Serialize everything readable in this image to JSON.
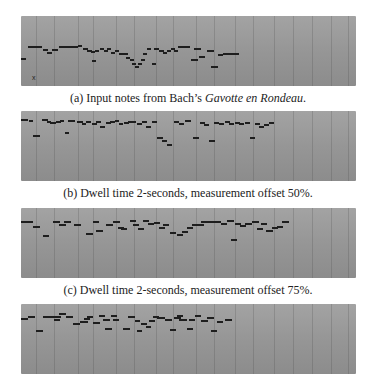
{
  "figure": {
    "panels": [
      {
        "id": "a",
        "top": 16,
        "caption_prefix": "(a) Input notes from Bach’s ",
        "caption_italic": "Gavotte en Rondeau",
        "caption_suffix": ".",
        "caption_top": 91,
        "marker": "x",
        "notes": [
          [
            0,
            42,
            5
          ],
          [
            7,
            30,
            14
          ],
          [
            22,
            33,
            5
          ],
          [
            26,
            36,
            5
          ],
          [
            31,
            33,
            6
          ],
          [
            38,
            30,
            19
          ],
          [
            57,
            29,
            4
          ],
          [
            62,
            32,
            5
          ],
          [
            66,
            34,
            5
          ],
          [
            70,
            35,
            4
          ],
          [
            71,
            44,
            4
          ],
          [
            74,
            34,
            4
          ],
          [
            79,
            32,
            4
          ],
          [
            83,
            34,
            4
          ],
          [
            86,
            32,
            4
          ],
          [
            90,
            36,
            4
          ],
          [
            94,
            34,
            4
          ],
          [
            98,
            37,
            4
          ],
          [
            102,
            37,
            5
          ],
          [
            105,
            41,
            4
          ],
          [
            109,
            43,
            4
          ],
          [
            111,
            47,
            4
          ],
          [
            114,
            50,
            4
          ],
          [
            117,
            47,
            4
          ],
          [
            120,
            43,
            4
          ],
          [
            122,
            37,
            4
          ],
          [
            126,
            32,
            4
          ],
          [
            131,
            47,
            4
          ],
          [
            133,
            32,
            5
          ],
          [
            138,
            34,
            5
          ],
          [
            142,
            36,
            4
          ],
          [
            146,
            34,
            4
          ],
          [
            150,
            32,
            4
          ],
          [
            153,
            34,
            4
          ],
          [
            157,
            30,
            12
          ],
          [
            170,
            43,
            7
          ],
          [
            173,
            32,
            7
          ],
          [
            178,
            40,
            6
          ],
          [
            186,
            34,
            7
          ],
          [
            190,
            50,
            7
          ],
          [
            197,
            38,
            5
          ],
          [
            202,
            37,
            5
          ],
          [
            206,
            37,
            12
          ]
        ]
      },
      {
        "id": "b",
        "top": 111,
        "caption_text": "(b) Dwell time 2-seconds, measurement offset 50%.",
        "caption_top": 186,
        "notes": [
          [
            0,
            8,
            7
          ],
          [
            8,
            9,
            4
          ],
          [
            12,
            24,
            7
          ],
          [
            21,
            8,
            6
          ],
          [
            26,
            10,
            4
          ],
          [
            29,
            11,
            6
          ],
          [
            35,
            10,
            5
          ],
          [
            39,
            9,
            4
          ],
          [
            44,
            21,
            4
          ],
          [
            47,
            9,
            7
          ],
          [
            56,
            10,
            6
          ],
          [
            61,
            12,
            4
          ],
          [
            65,
            10,
            5
          ],
          [
            71,
            12,
            5
          ],
          [
            75,
            10,
            5
          ],
          [
            79,
            15,
            5
          ],
          [
            85,
            11,
            5
          ],
          [
            89,
            10,
            5
          ],
          [
            94,
            9,
            4
          ],
          [
            98,
            12,
            4
          ],
          [
            103,
            11,
            5
          ],
          [
            107,
            10,
            5
          ],
          [
            111,
            10,
            4
          ],
          [
            116,
            12,
            5
          ],
          [
            121,
            10,
            5
          ],
          [
            125,
            15,
            5
          ],
          [
            131,
            10,
            5
          ],
          [
            136,
            26,
            6
          ],
          [
            141,
            29,
            5
          ],
          [
            146,
            33,
            5
          ],
          [
            153,
            10,
            5
          ],
          [
            158,
            12,
            5
          ],
          [
            164,
            9,
            6
          ],
          [
            172,
            26,
            6
          ],
          [
            179,
            11,
            5
          ],
          [
            183,
            13,
            5
          ],
          [
            188,
            29,
            6
          ],
          [
            193,
            11,
            5
          ],
          [
            198,
            12,
            5
          ],
          [
            204,
            10,
            5
          ],
          [
            208,
            12,
            5
          ],
          [
            214,
            11,
            5
          ],
          [
            218,
            12,
            5
          ],
          [
            224,
            11,
            5
          ],
          [
            229,
            26,
            5
          ],
          [
            234,
            12,
            5
          ],
          [
            238,
            15,
            5
          ],
          [
            243,
            13,
            5
          ],
          [
            248,
            11,
            5
          ]
        ]
      },
      {
        "id": "c",
        "top": 208,
        "caption_text": "(c) Dwell time 2-seconds, measurement offset 75%.",
        "caption_top": 283,
        "notes": [
          [
            0,
            13,
            12
          ],
          [
            12,
            18,
            7
          ],
          [
            22,
            27,
            6
          ],
          [
            32,
            13,
            7
          ],
          [
            38,
            16,
            7
          ],
          [
            43,
            13,
            7
          ],
          [
            53,
            16,
            7
          ],
          [
            65,
            25,
            7
          ],
          [
            72,
            13,
            6
          ],
          [
            75,
            22,
            7
          ],
          [
            85,
            16,
            7
          ],
          [
            92,
            13,
            7
          ],
          [
            97,
            19,
            6
          ],
          [
            100,
            20,
            6
          ],
          [
            109,
            12,
            6
          ],
          [
            112,
            16,
            6
          ],
          [
            117,
            20,
            6
          ],
          [
            122,
            12,
            6
          ],
          [
            127,
            15,
            6
          ],
          [
            133,
            14,
            6
          ],
          [
            138,
            19,
            6
          ],
          [
            142,
            16,
            6
          ],
          [
            149,
            24,
            6
          ],
          [
            156,
            26,
            6
          ],
          [
            161,
            23,
            6
          ],
          [
            166,
            19,
            6
          ],
          [
            171,
            16,
            12
          ],
          [
            180,
            13,
            20
          ],
          [
            200,
            15,
            6
          ],
          [
            206,
            12,
            7
          ],
          [
            210,
            31,
            6
          ],
          [
            214,
            15,
            6
          ],
          [
            219,
            17,
            6
          ],
          [
            224,
            15,
            7
          ],
          [
            231,
            13,
            7
          ],
          [
            236,
            20,
            6
          ],
          [
            240,
            15,
            6
          ],
          [
            245,
            22,
            7
          ],
          [
            251,
            19,
            6
          ],
          [
            256,
            18,
            6
          ],
          [
            261,
            13,
            7
          ]
        ]
      },
      {
        "id": "d",
        "top": 304,
        "notes": [
          [
            0,
            14,
            7
          ],
          [
            7,
            12,
            7
          ],
          [
            15,
            26,
            7
          ],
          [
            22,
            12,
            12
          ],
          [
            33,
            12,
            7
          ],
          [
            33,
            15,
            6
          ],
          [
            38,
            9,
            7
          ],
          [
            45,
            12,
            7
          ],
          [
            52,
            19,
            7
          ],
          [
            59,
            17,
            8
          ],
          [
            63,
            14,
            6
          ],
          [
            66,
            12,
            6
          ],
          [
            72,
            18,
            7
          ],
          [
            78,
            11,
            6
          ],
          [
            82,
            15,
            7
          ],
          [
            84,
            24,
            7
          ],
          [
            90,
            11,
            6
          ],
          [
            92,
            15,
            6
          ],
          [
            102,
            24,
            7
          ],
          [
            107,
            12,
            7
          ],
          [
            114,
            16,
            5
          ],
          [
            116,
            26,
            5
          ],
          [
            120,
            19,
            6
          ],
          [
            125,
            22,
            5
          ],
          [
            128,
            16,
            6
          ],
          [
            132,
            12,
            6
          ],
          [
            136,
            13,
            8
          ],
          [
            144,
            15,
            7
          ],
          [
            149,
            25,
            6
          ],
          [
            153,
            13,
            7
          ],
          [
            156,
            11,
            6
          ],
          [
            158,
            15,
            8
          ],
          [
            166,
            24,
            6
          ],
          [
            168,
            15,
            6
          ],
          [
            174,
            11,
            6
          ],
          [
            180,
            16,
            7
          ],
          [
            186,
            13,
            7
          ],
          [
            190,
            26,
            6
          ],
          [
            196,
            17,
            6
          ],
          [
            204,
            15,
            7
          ]
        ]
      }
    ],
    "gridlines_x": [
      15,
      33,
      57,
      72,
      95,
      113,
      135,
      152,
      175,
      193,
      214,
      232,
      253,
      272,
      291,
      310,
      327
    ]
  }
}
